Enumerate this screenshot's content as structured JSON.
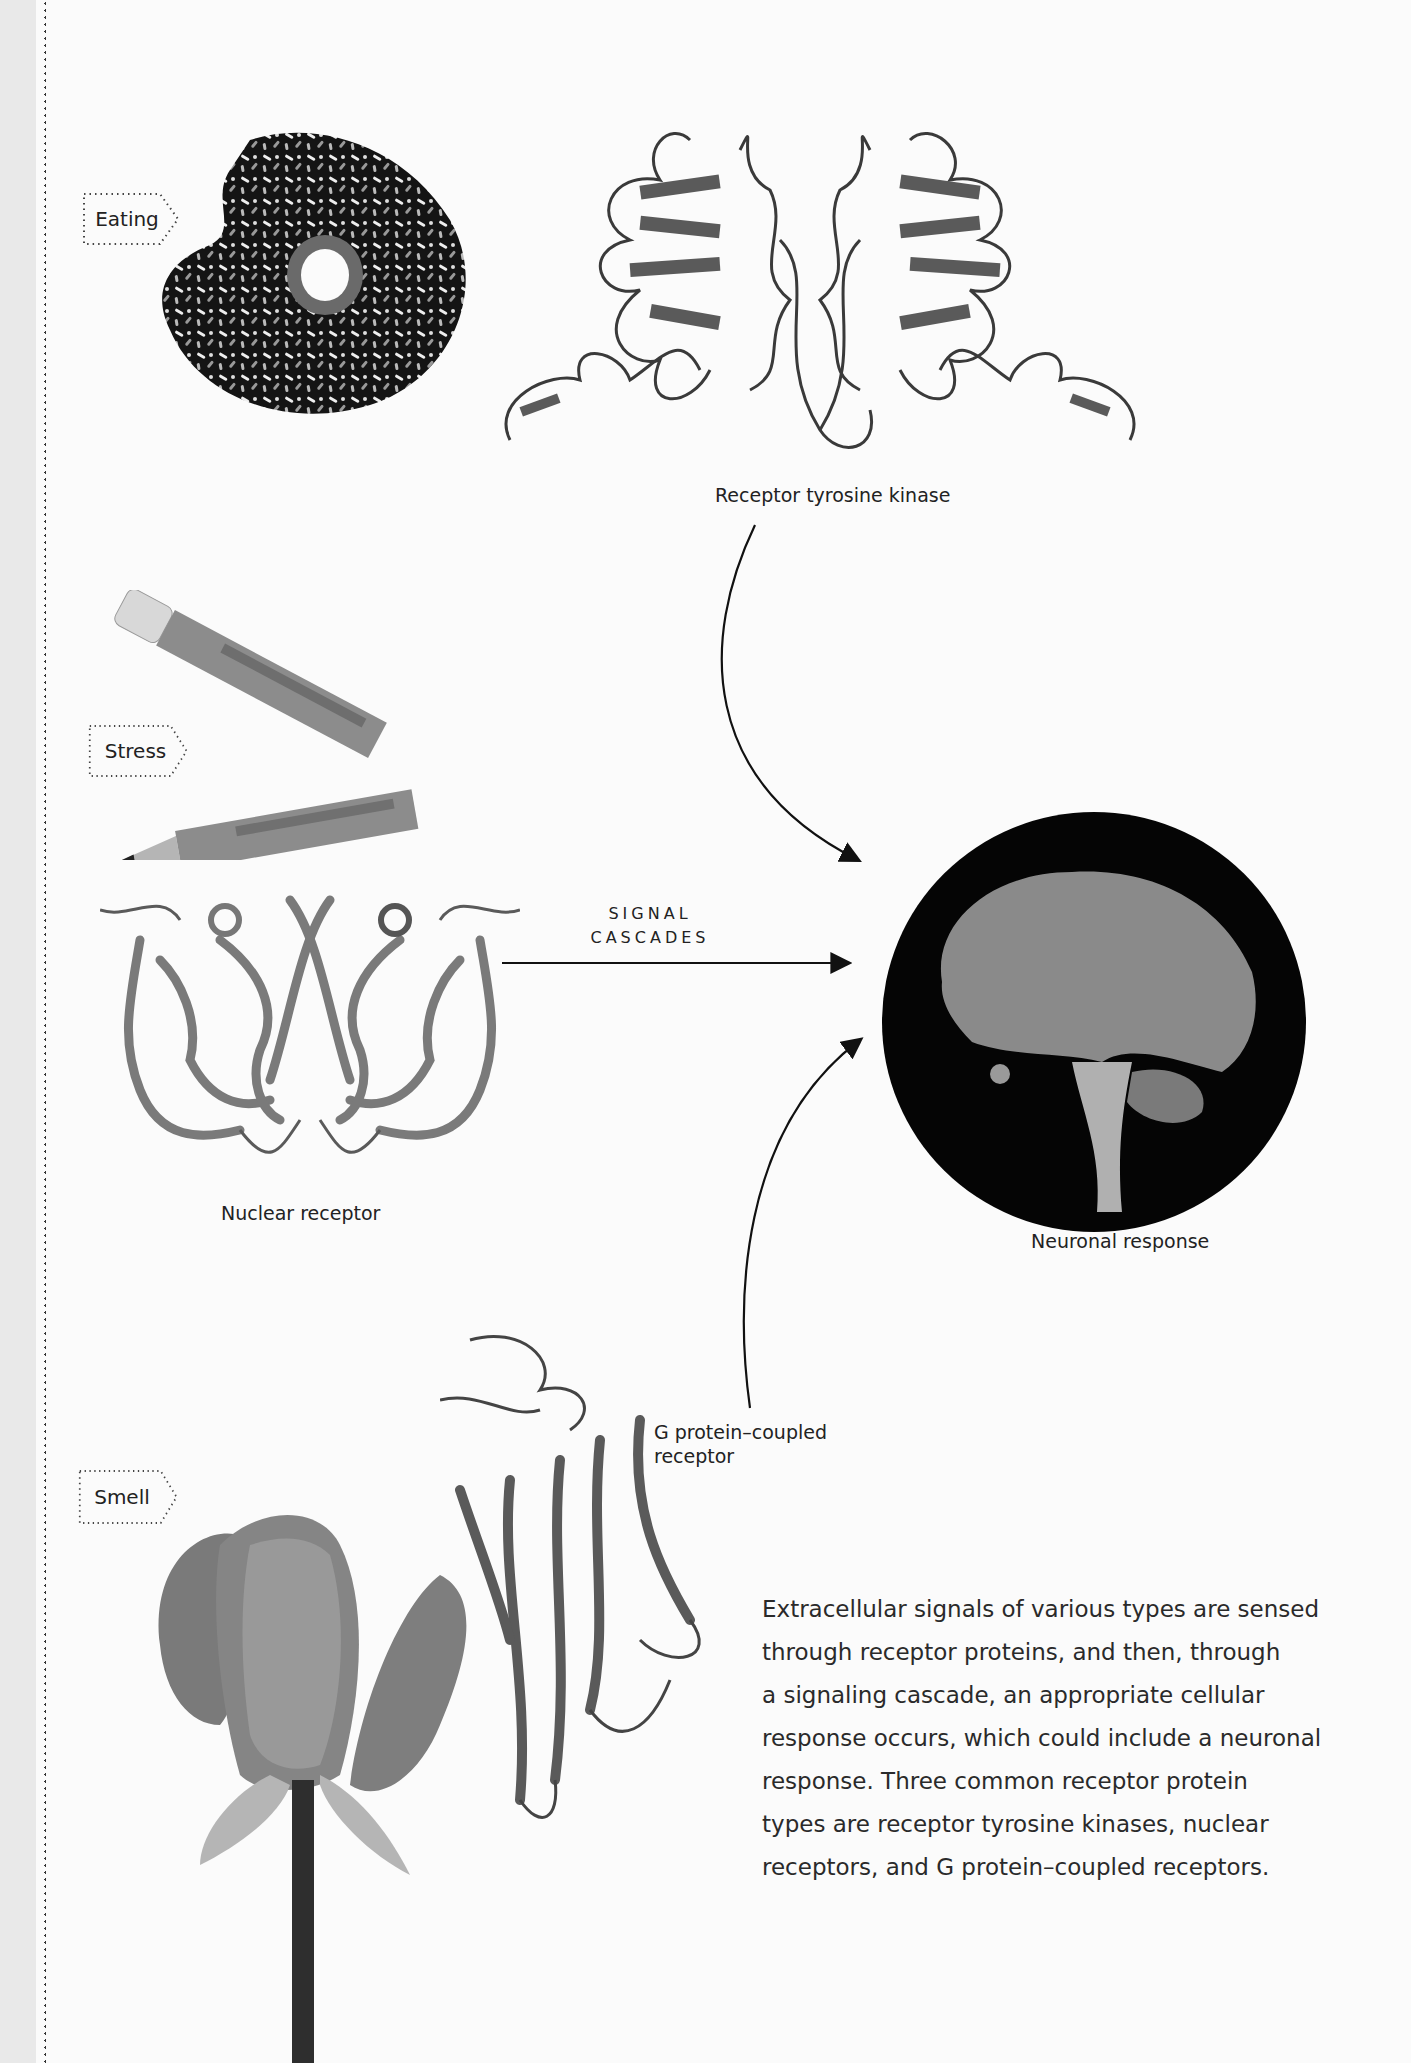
{
  "page": {
    "background": "#fbfbfb",
    "gutter_color": "#e9e9e9"
  },
  "stimuli": [
    {
      "id": "eating",
      "label": "Eating",
      "image": "chocolate-sprinkle-donut-photo"
    },
    {
      "id": "stress",
      "label": "Stress",
      "image": "broken-chewed-pencil-photo"
    },
    {
      "id": "smell",
      "label": "Smell",
      "image": "rose-bud-photo"
    }
  ],
  "receptors": {
    "rtk": {
      "label": "Receptor tyrosine kinase",
      "image": "rtk-ribbon-structure"
    },
    "nuclear": {
      "label": "Nuclear receptor",
      "image": "nuclear-receptor-ribbon-structure"
    },
    "gpcr": {
      "label_line1": "G protein–coupled",
      "label_line2": "receptor",
      "image": "gpcr-ribbon-structure"
    }
  },
  "signal": {
    "line1": "SIGNAL",
    "line2": "CASCADES"
  },
  "response": {
    "label": "Neuronal response",
    "image": "brain-tractography-circle"
  },
  "caption": {
    "lines": [
      "Extracellular signals of various types are sensed",
      "through receptor proteins, and then, through",
      "a signaling cascade, an appropriate cellular",
      "response occurs, which could include a neuronal",
      "response. Three common receptor protein",
      "types are receptor tyrosine kinases, nuclear",
      "receptors, and G protein–coupled receptors."
    ]
  }
}
